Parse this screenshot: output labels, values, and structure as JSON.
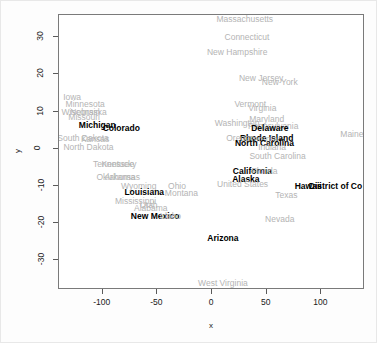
{
  "chart_data": {
    "type": "scatter",
    "title": "",
    "xlabel": "x",
    "ylabel": "y",
    "xlim": [
      -140,
      140
    ],
    "ylim": [
      -38,
      36
    ],
    "xticks": [
      -100,
      -50,
      0,
      50,
      100
    ],
    "yticks": [
      30,
      20,
      10,
      0,
      -10,
      -20,
      -30
    ],
    "grid": false,
    "legend": "none",
    "marker": "text-label",
    "label_colors": {
      "highlighted": "#000000",
      "normal": "#b4b4b4"
    },
    "points": [
      {
        "label": "Massachusetts",
        "x": 30,
        "y": 35,
        "highlight": false
      },
      {
        "label": "Connecticut",
        "x": 32,
        "y": 30,
        "highlight": false
      },
      {
        "label": "New Hampshire",
        "x": 23,
        "y": 26,
        "highlight": false
      },
      {
        "label": "New Jersey",
        "x": 45,
        "y": 19,
        "highlight": false
      },
      {
        "label": "New York",
        "x": 62,
        "y": 18,
        "highlight": false
      },
      {
        "label": "Iowa",
        "x": -128,
        "y": 14,
        "highlight": false
      },
      {
        "label": "Minnesota",
        "x": -116,
        "y": 12,
        "highlight": false
      },
      {
        "label": "Vermont",
        "x": 35,
        "y": 12,
        "highlight": false
      },
      {
        "label": "Virginia",
        "x": 46,
        "y": 11,
        "highlight": false
      },
      {
        "label": "Wisconsin",
        "x": -120,
        "y": 10,
        "highlight": false
      },
      {
        "label": "Nebraska",
        "x": -113,
        "y": 10,
        "highlight": false
      },
      {
        "label": "Missouri",
        "x": -117,
        "y": 8.5,
        "highlight": false
      },
      {
        "label": "Maryland",
        "x": 50,
        "y": 8,
        "highlight": false
      },
      {
        "label": "Washington",
        "x": 23,
        "y": 7,
        "highlight": false
      },
      {
        "label": "Michigan",
        "x": -105,
        "y": 6.5,
        "highlight": true
      },
      {
        "label": "Pennsylvania",
        "x": 56,
        "y": 6,
        "highlight": false
      },
      {
        "label": "Colorado",
        "x": -83,
        "y": 5.5,
        "highlight": true
      },
      {
        "label": "Delaware",
        "x": 53,
        "y": 5.5,
        "highlight": true
      },
      {
        "label": "Rhode Island",
        "x": 50,
        "y": 3,
        "highlight": true
      },
      {
        "label": "Oregon",
        "x": 26,
        "y": 3,
        "highlight": false
      },
      {
        "label": "Georgia",
        "x": 46,
        "y": 2.5,
        "highlight": false
      },
      {
        "label": "South Dakota",
        "x": -118,
        "y": 3,
        "highlight": false
      },
      {
        "label": "Kansas",
        "x": -107,
        "y": 2.5,
        "highlight": false
      },
      {
        "label": "Maine",
        "x": 128,
        "y": 4,
        "highlight": false
      },
      {
        "label": "North Carolina",
        "x": 48,
        "y": 1.5,
        "highlight": true
      },
      {
        "label": "Indiana",
        "x": 55,
        "y": 0.5,
        "highlight": false
      },
      {
        "label": "North Dakota",
        "x": -113,
        "y": 0.5,
        "highlight": false
      },
      {
        "label": "South Carolina",
        "x": 60,
        "y": -2,
        "highlight": false
      },
      {
        "label": "Tennessee",
        "x": -90,
        "y": -4,
        "highlight": false
      },
      {
        "label": "Kentucky",
        "x": -85,
        "y": -4,
        "highlight": false
      },
      {
        "label": "California",
        "x": 37,
        "y": -6,
        "highlight": true
      },
      {
        "label": "Florida",
        "x": 48,
        "y": -6,
        "highlight": false
      },
      {
        "label": "Oklahoma",
        "x": -88,
        "y": -7.5,
        "highlight": false
      },
      {
        "label": "Arkansas",
        "x": -82,
        "y": -7.5,
        "highlight": false
      },
      {
        "label": "Alaska",
        "x": 31,
        "y": -8,
        "highlight": true
      },
      {
        "label": "United States",
        "x": 28,
        "y": -9.5,
        "highlight": false
      },
      {
        "label": "Hawaii",
        "x": 88,
        "y": -10,
        "highlight": true
      },
      {
        "label": "District of Co",
        "x": 113,
        "y": -10,
        "highlight": true
      },
      {
        "label": "Wyoming",
        "x": -67,
        "y": -10,
        "highlight": false
      },
      {
        "label": "Ohio",
        "x": -32,
        "y": -10,
        "highlight": false
      },
      {
        "label": "Louisiana",
        "x": -62,
        "y": -11.5,
        "highlight": true
      },
      {
        "label": "Montana",
        "x": -28,
        "y": -12,
        "highlight": false
      },
      {
        "label": "Texas",
        "x": 68,
        "y": -12.5,
        "highlight": false
      },
      {
        "label": "Mississippi",
        "x": -70,
        "y": -14,
        "highlight": false
      },
      {
        "label": "Utah",
        "x": -58,
        "y": -15,
        "highlight": false
      },
      {
        "label": "Alabama",
        "x": -56,
        "y": -16,
        "highlight": false
      },
      {
        "label": "New Mexico",
        "x": -52,
        "y": -18,
        "highlight": true
      },
      {
        "label": "Idaho",
        "x": -38,
        "y": -18,
        "highlight": false
      },
      {
        "label": "Nevada",
        "x": 62,
        "y": -19,
        "highlight": false
      },
      {
        "label": "Arizona",
        "x": 10,
        "y": -24,
        "highlight": true
      },
      {
        "label": "West Virginia",
        "x": 10,
        "y": -36,
        "highlight": false
      }
    ]
  }
}
